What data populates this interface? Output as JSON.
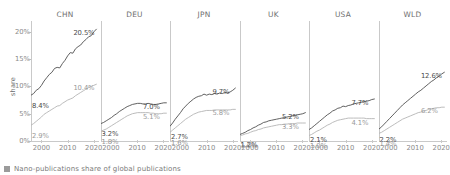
{
  "chart_data": {
    "type": "line",
    "title": "",
    "caption": "Nano-publications share of global publications",
    "ylabel": "share",
    "xlabel": "",
    "ylim": [
      0,
      22
    ],
    "xlim": [
      1996,
      2022
    ],
    "yticks": [
      "0%",
      "5%",
      "10%",
      "15%",
      "20%"
    ],
    "ytick_values": [
      0,
      5,
      10,
      15,
      20
    ],
    "xticks": [
      "2000",
      "2010",
      "2020"
    ],
    "xtick_values": [
      2000,
      2010,
      2020
    ],
    "grid": false,
    "legend_position": "bottom-left",
    "legend": [
      "Nano-publications share of global publications"
    ],
    "facets": [
      {
        "name": "CHN",
        "series": [
          {
            "name": "upper",
            "style": "dark",
            "start_label": "8.4%",
            "end_label": "20.5%",
            "x": [
              1996,
              1997,
              1998,
              1999,
              2000,
              2001,
              2002,
              2003,
              2004,
              2005,
              2006,
              2007,
              2008,
              2009,
              2010,
              2011,
              2012,
              2013,
              2014,
              2015,
              2016,
              2017,
              2018,
              2019,
              2020,
              2021
            ],
            "values": [
              8.4,
              8.7,
              9.3,
              9.6,
              10.2,
              11.0,
              11.6,
              12.2,
              12.6,
              13.3,
              13.5,
              13.4,
              14.2,
              14.8,
              15.6,
              16.2,
              16.1,
              16.9,
              17.3,
              17.6,
              18.2,
              18.6,
              19.1,
              19.3,
              20.0,
              20.5
            ]
          },
          {
            "name": "lower",
            "style": "light",
            "start_label": "2.9%",
            "end_label": "10.4%",
            "x": [
              1996,
              1997,
              1998,
              1999,
              2000,
              2001,
              2002,
              2003,
              2004,
              2005,
              2006,
              2007,
              2008,
              2009,
              2010,
              2011,
              2012,
              2013,
              2014,
              2015,
              2016,
              2017,
              2018,
              2019,
              2020,
              2021
            ],
            "values": [
              2.9,
              3.2,
              3.6,
              4.0,
              4.4,
              4.9,
              5.2,
              5.5,
              5.8,
              6.1,
              6.4,
              6.5,
              6.9,
              7.2,
              7.5,
              7.7,
              7.9,
              8.3,
              8.6,
              8.9,
              9.2,
              9.5,
              9.8,
              10.0,
              10.2,
              10.4
            ]
          }
        ]
      },
      {
        "name": "DEU",
        "series": [
          {
            "name": "upper",
            "style": "dark",
            "start_label": "3.2%",
            "end_label": "7.0%",
            "x": [
              1996,
              1997,
              1998,
              1999,
              2000,
              2001,
              2002,
              2003,
              2004,
              2005,
              2006,
              2007,
              2008,
              2009,
              2010,
              2011,
              2012,
              2013,
              2014,
              2015,
              2016,
              2017,
              2018,
              2019,
              2020,
              2021
            ],
            "values": [
              3.2,
              3.4,
              3.7,
              4.0,
              4.3,
              4.7,
              5.0,
              5.4,
              5.7,
              6.0,
              6.3,
              6.5,
              6.7,
              6.8,
              6.9,
              6.9,
              6.8,
              6.8,
              6.9,
              6.8,
              6.7,
              6.7,
              6.8,
              6.9,
              7.0,
              7.0
            ]
          },
          {
            "name": "lower",
            "style": "light",
            "start_label": "1.8%",
            "end_label": "5.1%",
            "x": [
              1996,
              1997,
              1998,
              1999,
              2000,
              2001,
              2002,
              2003,
              2004,
              2005,
              2006,
              2007,
              2008,
              2009,
              2010,
              2011,
              2012,
              2013,
              2014,
              2015,
              2016,
              2017,
              2018,
              2019,
              2020,
              2021
            ],
            "values": [
              1.8,
              2.0,
              2.2,
              2.5,
              2.8,
              3.1,
              3.4,
              3.7,
              4.0,
              4.3,
              4.6,
              4.8,
              5.0,
              5.1,
              5.2,
              5.2,
              5.2,
              5.2,
              5.2,
              5.1,
              5.1,
              5.0,
              5.0,
              5.0,
              5.1,
              5.1
            ]
          }
        ]
      },
      {
        "name": "JPN",
        "series": [
          {
            "name": "upper",
            "style": "dark",
            "start_label": "2.7%",
            "end_label": "9.7%",
            "x": [
              1996,
              1997,
              1998,
              1999,
              2000,
              2001,
              2002,
              2003,
              2004,
              2005,
              2006,
              2007,
              2008,
              2009,
              2010,
              2011,
              2012,
              2013,
              2014,
              2015,
              2016,
              2017,
              2018,
              2019,
              2020,
              2021
            ],
            "values": [
              2.7,
              3.3,
              4.0,
              4.6,
              5.2,
              5.9,
              6.4,
              6.9,
              7.3,
              7.7,
              8.0,
              8.2,
              8.3,
              8.6,
              8.4,
              8.6,
              8.5,
              8.7,
              8.6,
              8.8,
              8.7,
              8.9,
              8.8,
              9.0,
              9.3,
              9.7
            ]
          },
          {
            "name": "lower",
            "style": "light",
            "start_label": "1.6%",
            "end_label": "5.8%",
            "x": [
              1996,
              1997,
              1998,
              1999,
              2000,
              2001,
              2002,
              2003,
              2004,
              2005,
              2006,
              2007,
              2008,
              2009,
              2010,
              2011,
              2012,
              2013,
              2014,
              2015,
              2016,
              2017,
              2018,
              2019,
              2020,
              2021
            ],
            "values": [
              1.6,
              2.0,
              2.4,
              2.8,
              3.2,
              3.6,
              4.0,
              4.3,
              4.6,
              4.9,
              5.1,
              5.3,
              5.4,
              5.5,
              5.6,
              5.6,
              5.6,
              5.7,
              5.7,
              5.7,
              5.7,
              5.7,
              5.7,
              5.7,
              5.8,
              5.8
            ]
          }
        ]
      },
      {
        "name": "UK",
        "series": [
          {
            "name": "upper",
            "style": "dark",
            "start_label": "1.2%",
            "end_label": "5.2%",
            "x": [
              1996,
              1997,
              1998,
              1999,
              2000,
              2001,
              2002,
              2003,
              2004,
              2005,
              2006,
              2007,
              2008,
              2009,
              2010,
              2011,
              2012,
              2013,
              2014,
              2015,
              2016,
              2017,
              2018,
              2019,
              2020,
              2021
            ],
            "values": [
              1.2,
              1.4,
              1.6,
              1.9,
              2.1,
              2.4,
              2.6,
              2.9,
              3.1,
              3.4,
              3.5,
              3.7,
              3.8,
              3.9,
              4.0,
              4.1,
              4.2,
              4.3,
              4.4,
              4.5,
              4.6,
              4.7,
              4.8,
              4.9,
              5.0,
              5.2
            ]
          },
          {
            "name": "lower",
            "style": "light",
            "start_label": "1.0%",
            "end_label": "3.3%",
            "x": [
              1996,
              1997,
              1998,
              1999,
              2000,
              2001,
              2002,
              2003,
              2004,
              2005,
              2006,
              2007,
              2008,
              2009,
              2010,
              2011,
              2012,
              2013,
              2014,
              2015,
              2016,
              2017,
              2018,
              2019,
              2020,
              2021
            ],
            "values": [
              1.0,
              1.1,
              1.3,
              1.4,
              1.6,
              1.8,
              1.9,
              2.1,
              2.2,
              2.4,
              2.5,
              2.6,
              2.7,
              2.8,
              2.9,
              3.0,
              3.0,
              3.1,
              3.1,
              3.2,
              3.2,
              3.2,
              3.3,
              3.3,
              3.3,
              3.3
            ]
          }
        ]
      },
      {
        "name": "USA",
        "series": [
          {
            "name": "upper",
            "style": "dark",
            "start_label": "2.1%",
            "end_label": "7.7%",
            "x": [
              1996,
              1997,
              1998,
              1999,
              2000,
              2001,
              2002,
              2003,
              2004,
              2005,
              2006,
              2007,
              2008,
              2009,
              2010,
              2011,
              2012,
              2013,
              2014,
              2015,
              2016,
              2017,
              2018,
              2019,
              2020,
              2021
            ],
            "values": [
              2.1,
              2.4,
              2.8,
              3.2,
              3.6,
              4.0,
              4.4,
              4.8,
              5.1,
              5.5,
              5.7,
              6.0,
              6.1,
              6.4,
              6.3,
              6.5,
              6.6,
              6.8,
              6.9,
              7.0,
              7.1,
              7.2,
              7.3,
              7.4,
              7.6,
              7.7
            ]
          },
          {
            "name": "lower",
            "style": "light",
            "start_label": "1.0%",
            "end_label": "4.1%",
            "x": [
              1996,
              1997,
              1998,
              1999,
              2000,
              2001,
              2002,
              2003,
              2004,
              2005,
              2006,
              2007,
              2008,
              2009,
              2010,
              2011,
              2012,
              2013,
              2014,
              2015,
              2016,
              2017,
              2018,
              2019,
              2020,
              2021
            ],
            "values": [
              1.0,
              1.2,
              1.5,
              1.8,
              2.0,
              2.3,
              2.6,
              2.9,
              3.1,
              3.4,
              3.6,
              3.8,
              3.9,
              4.0,
              4.1,
              4.2,
              4.2,
              4.2,
              4.2,
              4.2,
              4.2,
              4.2,
              4.1,
              4.1,
              4.1,
              4.1
            ]
          }
        ]
      },
      {
        "name": "WLD",
        "series": [
          {
            "name": "upper",
            "style": "dark",
            "start_label": "2.2%",
            "end_label": "12.6%",
            "x": [
              1996,
              1997,
              1998,
              1999,
              2000,
              2001,
              2002,
              2003,
              2004,
              2005,
              2006,
              2007,
              2008,
              2009,
              2010,
              2011,
              2012,
              2013,
              2014,
              2015,
              2016,
              2017,
              2018,
              2019,
              2020,
              2021
            ],
            "values": [
              2.2,
              2.6,
              3.1,
              3.6,
              4.1,
              4.6,
              5.1,
              5.6,
              6.1,
              6.6,
              7.0,
              7.4,
              7.8,
              8.2,
              8.6,
              9.0,
              9.3,
              9.7,
              10.1,
              10.5,
              10.9,
              11.2,
              11.6,
              11.9,
              12.3,
              12.6
            ]
          },
          {
            "name": "lower",
            "style": "light",
            "start_label": "1.4%",
            "end_label": "6.2%",
            "x": [
              1996,
              1997,
              1998,
              1999,
              2000,
              2001,
              2002,
              2003,
              2004,
              2005,
              2006,
              2007,
              2008,
              2009,
              2010,
              2011,
              2012,
              2013,
              2014,
              2015,
              2016,
              2017,
              2018,
              2019,
              2020,
              2021
            ],
            "values": [
              1.4,
              1.6,
              1.9,
              2.2,
              2.5,
              2.8,
              3.1,
              3.4,
              3.7,
              4.0,
              4.2,
              4.4,
              4.6,
              4.8,
              5.0,
              5.2,
              5.3,
              5.5,
              5.6,
              5.8,
              5.9,
              6.0,
              6.1,
              6.1,
              6.2,
              6.2
            ]
          }
        ]
      }
    ]
  },
  "colors": {
    "dark_line": "#4f4f4f",
    "light_line": "#b4b4b4",
    "axis": "#c9c9c9",
    "text": "#8a8a8a",
    "legend_swatch": "#9b9b9b"
  }
}
